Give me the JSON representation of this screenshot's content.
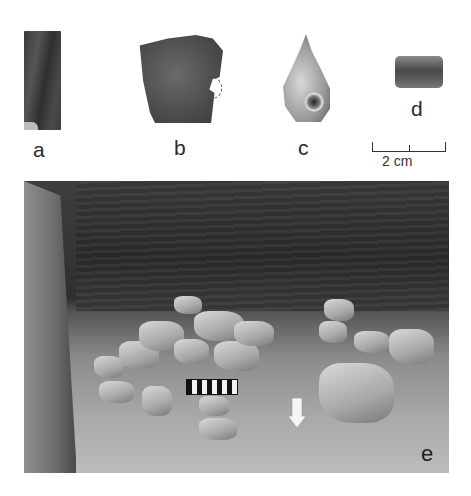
{
  "figure": {
    "panels": [
      {
        "id": "a",
        "label": "a",
        "description": "dark rectangular artifact fragment"
      },
      {
        "id": "b",
        "label": "b",
        "description": "irregular sherd with dashed-outline perforation notch"
      },
      {
        "id": "c",
        "label": "c",
        "description": "gastropod shell"
      },
      {
        "id": "d",
        "label": "d",
        "description": "cylindrical bead"
      },
      {
        "id": "e",
        "label": "e",
        "description": "excavation photo of stone feature with photo scale and north arrow"
      }
    ],
    "scale_bar": {
      "label": "2 cm",
      "ticks": 3
    },
    "colors": {
      "background": "#ffffff",
      "text": "#2a2a2a"
    }
  }
}
